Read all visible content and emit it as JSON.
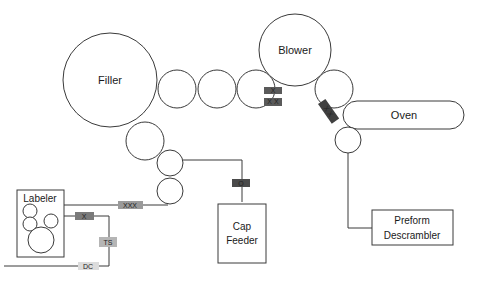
{
  "diagram": {
    "type": "bottling line layout",
    "machines": {
      "filler": "Filler",
      "blower": "Blower",
      "oven": "Oven",
      "labeler": "Labeler",
      "cap_feeder_line1": "Cap",
      "cap_feeder_line2": "Feeder",
      "preform_line1": "Preform",
      "preform_line2": "Descrambler"
    },
    "tags": {
      "blower_out_top": "X",
      "blower_out_bottom": "X X",
      "oven_in": "X X",
      "filler_to_labeler": "XXX",
      "cap_feeder": "O",
      "labeler_out": "X",
      "ts": "TS",
      "dc": "DC"
    },
    "colors": {
      "dark_tag": "#5a5a5a",
      "mid_tag": "#8a8a8a",
      "light_tag": "#b5b5b5",
      "pale_tag": "#d8d8d8",
      "stroke": "#3a3a3a"
    }
  }
}
